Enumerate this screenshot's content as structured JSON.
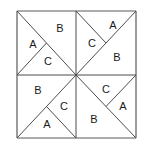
{
  "figure": {
    "type": "geometric-diagram",
    "background_color": "#ffffff",
    "stroke_color": "#4d4d4d",
    "outer_border_color": "#5a5a5a",
    "label_color": "#1a1a1a",
    "square": {
      "left": 17,
      "top": 11,
      "right": 136,
      "bottom": 138,
      "center_x": 76,
      "center_y": 75
    },
    "quadrants": [
      {
        "name": "top-left",
        "labels": [
          {
            "text": "A",
            "x": 33,
            "y": 45
          },
          {
            "text": "B",
            "x": 60,
            "y": 29
          },
          {
            "text": "C",
            "x": 48,
            "y": 62
          }
        ]
      },
      {
        "name": "top-right",
        "labels": [
          {
            "text": "C",
            "x": 92,
            "y": 44
          },
          {
            "text": "A",
            "x": 113,
            "y": 26
          },
          {
            "text": "B",
            "x": 117,
            "y": 58
          }
        ]
      },
      {
        "name": "bottom-left",
        "labels": [
          {
            "text": "B",
            "x": 38,
            "y": 91
          },
          {
            "text": "C",
            "x": 64,
            "y": 107
          },
          {
            "text": "A",
            "x": 47,
            "y": 125
          }
        ]
      },
      {
        "name": "bottom-right",
        "labels": [
          {
            "text": "C",
            "x": 106,
            "y": 90
          },
          {
            "text": "A",
            "x": 123,
            "y": 107
          },
          {
            "text": "B",
            "x": 94,
            "y": 120
          }
        ]
      }
    ],
    "lines": {
      "outer_square": [
        {
          "x1": 17,
          "y1": 11,
          "x2": 136,
          "y2": 11
        },
        {
          "x1": 136,
          "y1": 11,
          "x2": 136,
          "y2": 138
        },
        {
          "x1": 136,
          "y1": 138,
          "x2": 17,
          "y2": 138
        },
        {
          "x1": 17,
          "y1": 138,
          "x2": 17,
          "y2": 11
        }
      ],
      "midlines": [
        {
          "x1": 17,
          "y1": 75,
          "x2": 136,
          "y2": 75
        },
        {
          "x1": 76,
          "y1": 11,
          "x2": 76,
          "y2": 138
        }
      ],
      "quadrant_diagonals": [
        {
          "x1": 17,
          "y1": 11,
          "x2": 76,
          "y2": 75
        },
        {
          "x1": 136,
          "y1": 11,
          "x2": 76,
          "y2": 75
        },
        {
          "x1": 17,
          "y1": 138,
          "x2": 76,
          "y2": 75
        },
        {
          "x1": 136,
          "y1": 138,
          "x2": 76,
          "y2": 75
        }
      ],
      "secondary_cuts": [
        {
          "x1": 17,
          "y1": 75,
          "x2": 46.5,
          "y2": 43
        },
        {
          "x1": 76,
          "y1": 11,
          "x2": 106,
          "y2": 43
        },
        {
          "x1": 76,
          "y1": 138,
          "x2": 46.5,
          "y2": 106.5
        },
        {
          "x1": 136,
          "y1": 75,
          "x2": 106,
          "y2": 106.5
        }
      ]
    }
  }
}
